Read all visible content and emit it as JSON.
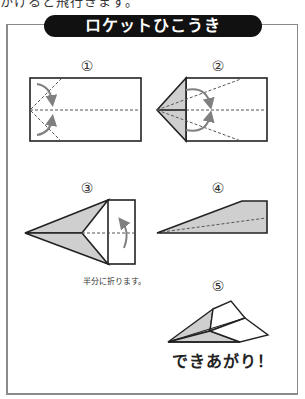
{
  "header": {
    "cut_off_text": "かけると飛行きます。",
    "title": "ロケットひこうき"
  },
  "steps": [
    {
      "number": "①",
      "caption": ""
    },
    {
      "number": "②",
      "caption": ""
    },
    {
      "number": "③",
      "caption": "半分に折ります。"
    },
    {
      "number": "④",
      "caption": ""
    },
    {
      "number": "⑤",
      "caption": ""
    }
  ],
  "footer": {
    "complete_text": "できあがり！"
  },
  "colors": {
    "outline": "#222222",
    "fill_shade": "#cfcfcf",
    "fold_line": "#555555",
    "arrow": "#808080",
    "frame": "#8a8a8a",
    "title_bg": "#111111",
    "title_fg": "#ffffff"
  }
}
